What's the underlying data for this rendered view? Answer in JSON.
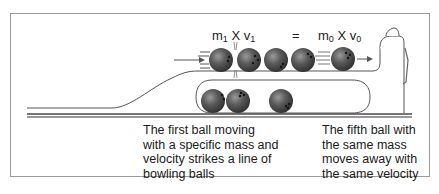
{
  "diagram": {
    "equation": {
      "left": {
        "m": "m",
        "m_sub": "1",
        "x": "X",
        "v": "v",
        "v_sub": "1"
      },
      "equals": "=",
      "right": {
        "m": "m",
        "m_sub": "0",
        "x": "X",
        "v": "v",
        "v_sub": "0"
      }
    },
    "captions": {
      "left": "The first ball moving with a specific mass and velocity strikes a line of bowling balls",
      "left_lines": [
        "The first ball moving",
        "with a specific mass and",
        "velocity strikes a line of",
        "bowling balls"
      ],
      "right": "The fifth ball with the same mass moves away with the same velocity",
      "right_lines": [
        "The fifth ball with",
        "the same mass",
        "moves away with",
        "the same velocity"
      ]
    },
    "elements": {
      "top_row_balls": 4,
      "moving_ball": 1,
      "return_track_balls": 3,
      "colors": {
        "ball": "#4a4a4a",
        "ball_highlight": "#8a8a8a",
        "line": "#555555",
        "frame": "#9a9a9a"
      }
    }
  }
}
